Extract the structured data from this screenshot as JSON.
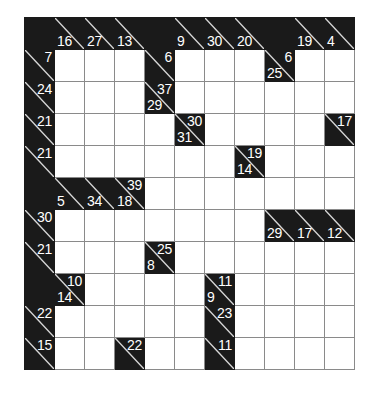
{
  "puzzle": {
    "type": "kakuro",
    "rows": 11,
    "cols": 11,
    "colors": {
      "block": "#1a1a1a",
      "cell": "#ffffff",
      "grid_line": "#8a8a8a",
      "clue_text": "#ffffff",
      "diagonal": "#d8d8d8",
      "background": "#ffffff"
    },
    "legend": {
      "across_note": "number in upper-right triangle is the sum of the run to the right",
      "down_note": "number in lower-left triangle is the sum of the run below"
    },
    "grid": [
      [
        {
          "t": "block"
        },
        {
          "t": "clue",
          "down": "16"
        },
        {
          "t": "clue",
          "down": "27"
        },
        {
          "t": "clue",
          "down": "13"
        },
        {
          "t": "block"
        },
        {
          "t": "clue",
          "down": "9"
        },
        {
          "t": "clue",
          "down": "30"
        },
        {
          "t": "clue",
          "down": "20"
        },
        {
          "t": "block"
        },
        {
          "t": "clue",
          "down": "19"
        },
        {
          "t": "clue",
          "down": "4"
        }
      ],
      [
        {
          "t": "clue",
          "across": "7"
        },
        {
          "t": "open"
        },
        {
          "t": "open"
        },
        {
          "t": "open"
        },
        {
          "t": "clue",
          "across": "6"
        },
        {
          "t": "open"
        },
        {
          "t": "open"
        },
        {
          "t": "open"
        },
        {
          "t": "clue",
          "across": "6",
          "down": "25"
        },
        {
          "t": "open"
        },
        {
          "t": "open"
        }
      ],
      [
        {
          "t": "clue",
          "across": "24"
        },
        {
          "t": "open"
        },
        {
          "t": "open"
        },
        {
          "t": "open"
        },
        {
          "t": "clue",
          "across": "37",
          "down": "29"
        },
        {
          "t": "open"
        },
        {
          "t": "open"
        },
        {
          "t": "open"
        },
        {
          "t": "open"
        },
        {
          "t": "open"
        },
        {
          "t": "open"
        }
      ],
      [
        {
          "t": "clue",
          "across": "21"
        },
        {
          "t": "open"
        },
        {
          "t": "open"
        },
        {
          "t": "open"
        },
        {
          "t": "open"
        },
        {
          "t": "clue",
          "across": "30",
          "down": "31"
        },
        {
          "t": "open"
        },
        {
          "t": "open"
        },
        {
          "t": "open"
        },
        {
          "t": "open"
        },
        {
          "t": "clue",
          "across": "17"
        }
      ],
      [
        {
          "t": "clue",
          "across": "21"
        },
        {
          "t": "open"
        },
        {
          "t": "open"
        },
        {
          "t": "open"
        },
        {
          "t": "open"
        },
        {
          "t": "open"
        },
        {
          "t": "open"
        },
        {
          "t": "clue",
          "across": "19",
          "down": "14"
        },
        {
          "t": "open"
        },
        {
          "t": "open"
        },
        {
          "t": "open"
        }
      ],
      [
        {
          "t": "block"
        },
        {
          "t": "clue",
          "down": "5"
        },
        {
          "t": "clue",
          "down": "34"
        },
        {
          "t": "clue",
          "across": "39",
          "down": "18"
        },
        {
          "t": "open"
        },
        {
          "t": "open"
        },
        {
          "t": "open"
        },
        {
          "t": "open"
        },
        {
          "t": "open"
        },
        {
          "t": "open"
        },
        {
          "t": "open"
        }
      ],
      [
        {
          "t": "clue",
          "across": "30"
        },
        {
          "t": "open"
        },
        {
          "t": "open"
        },
        {
          "t": "open"
        },
        {
          "t": "open"
        },
        {
          "t": "open"
        },
        {
          "t": "open"
        },
        {
          "t": "open"
        },
        {
          "t": "clue",
          "down": "29"
        },
        {
          "t": "clue",
          "down": "17"
        },
        {
          "t": "clue",
          "down": "12"
        }
      ],
      [
        {
          "t": "clue",
          "across": "21"
        },
        {
          "t": "open"
        },
        {
          "t": "open"
        },
        {
          "t": "open"
        },
        {
          "t": "clue",
          "across": "25",
          "down": "8"
        },
        {
          "t": "open"
        },
        {
          "t": "open"
        },
        {
          "t": "open"
        },
        {
          "t": "open"
        },
        {
          "t": "open"
        },
        {
          "t": "open"
        }
      ],
      [
        {
          "t": "block"
        },
        {
          "t": "clue",
          "across": "10",
          "down": "14"
        },
        {
          "t": "open"
        },
        {
          "t": "open"
        },
        {
          "t": "open"
        },
        {
          "t": "open"
        },
        {
          "t": "clue",
          "across": "11",
          "down": "9"
        },
        {
          "t": "open"
        },
        {
          "t": "open"
        },
        {
          "t": "open"
        },
        {
          "t": "open"
        }
      ],
      [
        {
          "t": "clue",
          "across": "22"
        },
        {
          "t": "open"
        },
        {
          "t": "open"
        },
        {
          "t": "open"
        },
        {
          "t": "open"
        },
        {
          "t": "open"
        },
        {
          "t": "clue",
          "across": "23"
        },
        {
          "t": "open"
        },
        {
          "t": "open"
        },
        {
          "t": "open"
        },
        {
          "t": "open"
        }
      ],
      [
        {
          "t": "clue",
          "across": "15"
        },
        {
          "t": "open"
        },
        {
          "t": "open"
        },
        {
          "t": "clue",
          "across": "22"
        },
        {
          "t": "open"
        },
        {
          "t": "open"
        },
        {
          "t": "clue",
          "across": "11"
        },
        {
          "t": "open"
        },
        {
          "t": "open"
        },
        {
          "t": "open"
        },
        {
          "t": "open"
        }
      ]
    ]
  }
}
